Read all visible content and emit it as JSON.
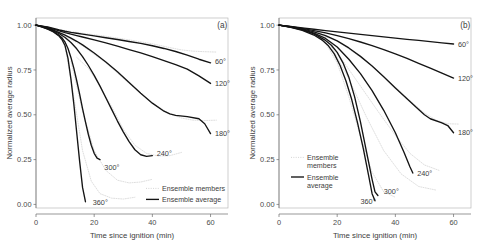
{
  "figure": {
    "panels": [
      {
        "tag": "(a)",
        "xlabel": "Time since ignition (min)",
        "ylabel": "Normalized average radius",
        "legend": {
          "members_label": "Ensemble members",
          "average_label": "Ensemble average",
          "members_label_line1": "Ensemble",
          "members_label_line2": "members",
          "average_label_line1": "Ensemble",
          "average_label_line2": "average"
        }
      },
      {
        "tag": "(b)",
        "xlabel": "Time since ignition (min)",
        "ylabel": "Normalized average radius",
        "legend": {
          "members_label": "Ensemble members",
          "average_label": "Ensemble average",
          "members_label_line1": "Ensemble",
          "members_label_line2": "members",
          "average_label_line1": "Ensemble",
          "average_label_line2": "average"
        }
      }
    ]
  },
  "chart_data": [
    {
      "type": "line",
      "panel": "(a)",
      "title": "",
      "xlabel": "Time since ignition (min)",
      "ylabel": "Normalized average radius",
      "xlim": [
        0,
        66
      ],
      "ylim": [
        -0.02,
        1.04
      ],
      "xticks": [
        0,
        20,
        40,
        60
      ],
      "xticklabels": [
        "0",
        "20",
        "40",
        "60"
      ],
      "yticks": [
        0.0,
        0.25,
        0.5,
        0.75,
        1.0
      ],
      "yticklabels": [
        "0.00",
        "0.25",
        "0.50",
        "0.75",
        "1.00"
      ],
      "grid": false,
      "legend": {
        "position": "bottom-right",
        "entries": [
          {
            "label": "Ensemble members",
            "style": "dotted",
            "color": "#c9c9c9"
          },
          {
            "label": "Ensemble average",
            "style": "solid",
            "color": "#141414"
          }
        ]
      },
      "annotations": [
        {
          "text": "(a)",
          "x": 63,
          "y": 1.0
        },
        {
          "text": "60°",
          "x": 61.5,
          "y": 0.8
        },
        {
          "text": "120°",
          "x": 61.5,
          "y": 0.675
        },
        {
          "text": "180°",
          "x": 61.5,
          "y": 0.395
        },
        {
          "text": "240°",
          "x": 41.5,
          "y": 0.285
        },
        {
          "text": "300°",
          "x": 23.5,
          "y": 0.205
        },
        {
          "text": "360°",
          "x": 19.5,
          "y": 0.012
        }
      ],
      "series": [
        {
          "name": "60°",
          "style": "solid",
          "x": [
            0,
            2,
            4,
            6,
            8,
            10,
            12,
            14,
            16,
            20,
            24,
            28,
            32,
            36,
            40,
            44,
            48,
            52,
            56,
            60
          ],
          "values": [
            1.0,
            0.995,
            0.99,
            0.982,
            0.973,
            0.966,
            0.96,
            0.955,
            0.95,
            0.94,
            0.93,
            0.92,
            0.909,
            0.898,
            0.885,
            0.87,
            0.853,
            0.833,
            0.81,
            0.79
          ]
        },
        {
          "name": "120°",
          "style": "solid",
          "x": [
            0,
            2,
            4,
            6,
            8,
            10,
            12,
            14,
            16,
            20,
            24,
            28,
            32,
            36,
            40,
            44,
            48,
            52,
            56,
            60
          ],
          "values": [
            1.0,
            0.994,
            0.987,
            0.978,
            0.968,
            0.958,
            0.95,
            0.942,
            0.934,
            0.918,
            0.901,
            0.883,
            0.864,
            0.845,
            0.824,
            0.802,
            0.78,
            0.755,
            0.717,
            0.675
          ]
        },
        {
          "name": "180°",
          "style": "solid",
          "x": [
            0,
            2,
            4,
            6,
            8,
            10,
            12,
            14,
            16,
            20,
            24,
            28,
            32,
            36,
            40,
            44,
            46,
            48,
            52,
            56,
            58,
            60
          ],
          "values": [
            1.0,
            0.993,
            0.984,
            0.973,
            0.959,
            0.944,
            0.928,
            0.91,
            0.89,
            0.845,
            0.795,
            0.74,
            0.68,
            0.62,
            0.565,
            0.52,
            0.505,
            0.497,
            0.49,
            0.478,
            0.45,
            0.395
          ]
        },
        {
          "name": "240°",
          "style": "solid",
          "x": [
            0,
            2,
            4,
            6,
            8,
            10,
            12,
            14,
            16,
            18,
            20,
            22,
            24,
            26,
            28,
            30,
            32,
            34,
            36,
            38,
            40
          ],
          "values": [
            1.0,
            0.992,
            0.982,
            0.969,
            0.952,
            0.931,
            0.903,
            0.868,
            0.825,
            0.775,
            0.72,
            0.66,
            0.595,
            0.53,
            0.465,
            0.405,
            0.35,
            0.305,
            0.277,
            0.268,
            0.272
          ]
        },
        {
          "name": "300°",
          "style": "solid",
          "x": [
            0,
            2,
            4,
            6,
            8,
            9,
            10,
            11,
            12,
            13,
            14,
            15,
            16,
            17,
            18,
            19,
            20,
            21,
            22
          ],
          "values": [
            1.0,
            0.991,
            0.98,
            0.965,
            0.943,
            0.928,
            0.905,
            0.87,
            0.82,
            0.76,
            0.69,
            0.615,
            0.535,
            0.46,
            0.39,
            0.33,
            0.285,
            0.258,
            0.25
          ]
        },
        {
          "name": "360°",
          "style": "solid",
          "x": [
            0,
            2,
            4,
            6,
            8,
            9,
            10,
            11,
            12,
            13,
            14,
            15,
            16,
            17
          ],
          "values": [
            1.0,
            0.99,
            0.978,
            0.962,
            0.938,
            0.918,
            0.885,
            0.815,
            0.7,
            0.56,
            0.4,
            0.24,
            0.095,
            0.015
          ]
        }
      ],
      "members": [
        {
          "name": "60°-member",
          "style": "dotted",
          "x": [
            0,
            8,
            16,
            24,
            32,
            40,
            46,
            50,
            54,
            58,
            62
          ],
          "values": [
            1.0,
            0.975,
            0.955,
            0.938,
            0.918,
            0.896,
            0.875,
            0.862,
            0.855,
            0.852,
            0.85
          ]
        },
        {
          "name": "180°-member",
          "style": "dotted",
          "x": [
            0,
            8,
            16,
            24,
            32,
            40,
            46,
            50,
            54,
            58,
            62
          ],
          "values": [
            1.0,
            0.955,
            0.885,
            0.79,
            0.675,
            0.565,
            0.505,
            0.482,
            0.47,
            0.468,
            0.47
          ]
        },
        {
          "name": "240°-member",
          "style": "dotted",
          "x": [
            14,
            18,
            22,
            26,
            30,
            34,
            38,
            42,
            46,
            50
          ],
          "values": [
            0.82,
            0.76,
            0.66,
            0.545,
            0.42,
            0.33,
            0.285,
            0.27,
            0.272,
            0.29
          ]
        },
        {
          "name": "300°-member",
          "style": "dotted",
          "x": [
            12,
            16,
            20,
            24,
            28,
            32,
            36,
            40
          ],
          "values": [
            0.8,
            0.52,
            0.3,
            0.19,
            0.135,
            0.12,
            0.125,
            0.14
          ]
        },
        {
          "name": "360°-member",
          "style": "dotted",
          "x": [
            10,
            13,
            16,
            19,
            22,
            26,
            30,
            34
          ],
          "values": [
            0.88,
            0.6,
            0.3,
            0.13,
            0.06,
            0.035,
            0.03,
            0.04
          ]
        }
      ]
    },
    {
      "type": "line",
      "panel": "(b)",
      "title": "",
      "xlabel": "Time since ignition (min)",
      "ylabel": "Normalized average radius",
      "xlim": [
        0,
        66
      ],
      "ylim": [
        -0.02,
        1.04
      ],
      "xticks": [
        0,
        20,
        40,
        60
      ],
      "xticklabels": [
        "0",
        "20",
        "40",
        "60"
      ],
      "yticks": [
        0.0,
        0.25,
        0.5,
        0.75,
        1.0
      ],
      "yticklabels": [
        "0.00",
        "0.25",
        "0.50",
        "0.75",
        "1.00"
      ],
      "grid": false,
      "legend": {
        "position": "left-middle",
        "entries": [
          {
            "label": "Ensemble members",
            "style": "dotted",
            "color": "#c9c9c9"
          },
          {
            "label": "Ensemble average",
            "style": "solid",
            "color": "#141414"
          }
        ]
      },
      "annotations": [
        {
          "text": "(b)",
          "x": 63,
          "y": 1.0
        },
        {
          "text": "60°",
          "x": 61.5,
          "y": 0.895
        },
        {
          "text": "120°",
          "x": 61.5,
          "y": 0.705
        },
        {
          "text": "180°",
          "x": 61.5,
          "y": 0.4
        },
        {
          "text": "240°",
          "x": 47.5,
          "y": 0.175
        },
        {
          "text": "300°",
          "x": 36.0,
          "y": 0.075
        },
        {
          "text": "360°",
          "x": 28.0,
          "y": 0.018
        }
      ],
      "series": [
        {
          "name": "60°",
          "style": "solid",
          "x": [
            0,
            4,
            8,
            12,
            16,
            20,
            24,
            28,
            32,
            36,
            40,
            44,
            48,
            52,
            56,
            60
          ],
          "values": [
            1.0,
            0.993,
            0.985,
            0.977,
            0.97,
            0.963,
            0.956,
            0.949,
            0.942,
            0.935,
            0.928,
            0.921,
            0.915,
            0.908,
            0.901,
            0.895
          ]
        },
        {
          "name": "120°",
          "style": "solid",
          "x": [
            0,
            4,
            8,
            12,
            16,
            20,
            24,
            28,
            32,
            36,
            40,
            44,
            48,
            52,
            56,
            60
          ],
          "values": [
            1.0,
            0.992,
            0.982,
            0.97,
            0.957,
            0.942,
            0.925,
            0.906,
            0.886,
            0.864,
            0.84,
            0.815,
            0.787,
            0.76,
            0.732,
            0.705
          ]
        },
        {
          "name": "180°",
          "style": "solid",
          "x": [
            0,
            4,
            8,
            12,
            16,
            20,
            24,
            28,
            32,
            36,
            40,
            44,
            48,
            50,
            52,
            56,
            58,
            60
          ],
          "values": [
            1.0,
            0.991,
            0.979,
            0.963,
            0.942,
            0.912,
            0.873,
            0.826,
            0.772,
            0.712,
            0.65,
            0.59,
            0.53,
            0.5,
            0.478,
            0.455,
            0.44,
            0.4
          ]
        },
        {
          "name": "240°",
          "style": "solid",
          "x": [
            0,
            4,
            8,
            12,
            16,
            20,
            24,
            28,
            32,
            36,
            40,
            43,
            45,
            46
          ],
          "values": [
            1.0,
            0.99,
            0.976,
            0.956,
            0.926,
            0.878,
            0.81,
            0.73,
            0.635,
            0.525,
            0.4,
            0.29,
            0.21,
            0.175
          ]
        },
        {
          "name": "300°",
          "style": "solid",
          "x": [
            0,
            4,
            8,
            12,
            16,
            18,
            20,
            22,
            24,
            26,
            28,
            30,
            32,
            33,
            34
          ],
          "values": [
            1.0,
            0.989,
            0.974,
            0.951,
            0.915,
            0.888,
            0.848,
            0.79,
            0.71,
            0.6,
            0.46,
            0.3,
            0.14,
            0.07,
            0.05
          ]
        },
        {
          "name": "360°",
          "style": "solid",
          "x": [
            0,
            4,
            8,
            12,
            15,
            17,
            19,
            21,
            23,
            25,
            27,
            29,
            31,
            32,
            33
          ],
          "values": [
            1.0,
            0.988,
            0.971,
            0.945,
            0.915,
            0.885,
            0.84,
            0.775,
            0.69,
            0.585,
            0.455,
            0.31,
            0.145,
            0.06,
            0.02
          ]
        }
      ],
      "members": [
        {
          "name": "180°-member",
          "style": "dotted",
          "x": [
            0,
            10,
            20,
            30,
            40,
            46,
            50,
            54,
            58,
            62
          ],
          "values": [
            1.0,
            0.97,
            0.912,
            0.8,
            0.655,
            0.565,
            0.51,
            0.47,
            0.45,
            0.448
          ]
        },
        {
          "name": "240°-member",
          "style": "dotted",
          "x": [
            16,
            22,
            28,
            34,
            40,
            45,
            50,
            55
          ],
          "values": [
            0.93,
            0.8,
            0.66,
            0.52,
            0.385,
            0.285,
            0.22,
            0.19
          ]
        },
        {
          "name": "300°-member",
          "style": "dotted",
          "x": [
            18,
            24,
            30,
            36,
            42,
            48,
            54
          ],
          "values": [
            0.88,
            0.7,
            0.49,
            0.3,
            0.17,
            0.1,
            0.08
          ]
        },
        {
          "name": "360°-member",
          "style": "dotted",
          "x": [
            16,
            20,
            24,
            28,
            32,
            36,
            40
          ],
          "values": [
            0.9,
            0.79,
            0.6,
            0.38,
            0.18,
            0.07,
            0.04
          ]
        }
      ]
    }
  ]
}
